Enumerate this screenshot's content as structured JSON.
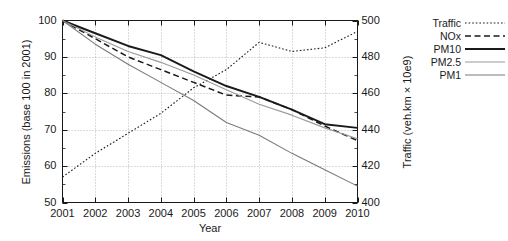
{
  "chart_data": {
    "type": "line",
    "title": "",
    "xlabel": "Year",
    "ylabel": "Emissions (base 100 in 2001)",
    "ylabel_right": "Traffic (veh.km × 10e9)",
    "x": [
      2001,
      2002,
      2003,
      2004,
      2005,
      2006,
      2007,
      2008,
      2009,
      2010
    ],
    "xticks": [
      "2001",
      "2002",
      "2003",
      "2004",
      "2005",
      "2006",
      "2007",
      "2008",
      "2009",
      "2010"
    ],
    "yticks_left": [
      "50",
      "60",
      "70",
      "80",
      "90",
      "100"
    ],
    "yticks_right": [
      "400",
      "420",
      "440",
      "460",
      "480",
      "500"
    ],
    "ylim": [
      50,
      100
    ],
    "ylim_right": [
      400,
      500
    ],
    "xlim": [
      2001,
      2010
    ],
    "grid": true,
    "legend_position": "right-outside",
    "series": [
      {
        "name": "Traffic",
        "axis": "right",
        "style": "dotted",
        "color": "#1a1a1a",
        "values_right": [
          414,
          427,
          438,
          449,
          463,
          473,
          488,
          483,
          485,
          494
        ],
        "values_left": [
          57.0,
          63.5,
          69.0,
          74.5,
          81.5,
          86.5,
          94.0,
          91.5,
          92.5,
          97.0
        ]
      },
      {
        "name": "NOx",
        "axis": "left",
        "style": "dashed",
        "color": "#1a1a1a",
        "values_left": [
          100.0,
          95.0,
          90.0,
          86.5,
          83.0,
          79.5,
          79.0,
          75.5,
          71.0,
          67.0
        ]
      },
      {
        "name": "PM10",
        "axis": "left",
        "style": "solid",
        "color": "#1a1a1a",
        "values_left": [
          100.0,
          96.5,
          93.0,
          90.5,
          86.0,
          82.0,
          79.0,
          75.5,
          71.5,
          70.5
        ]
      },
      {
        "name": "PM2.5",
        "axis": "left",
        "style": "solid",
        "color": "#9a9a9a",
        "values_left": [
          100.0,
          95.5,
          91.5,
          88.5,
          85.0,
          81.0,
          77.0,
          74.0,
          70.5,
          67.5
        ]
      },
      {
        "name": "PM1",
        "axis": "left",
        "style": "solid",
        "color": "#7a7a7a",
        "values_left": [
          100.0,
          93.5,
          88.0,
          83.0,
          78.0,
          72.0,
          68.5,
          63.5,
          59.0,
          54.5
        ]
      }
    ]
  },
  "legend": {
    "items": [
      {
        "label": "Traffic",
        "style": "dotted",
        "color": "#1a1a1a"
      },
      {
        "label": "NOx",
        "style": "dashed",
        "color": "#1a1a1a"
      },
      {
        "label": "PM10",
        "style": "solid",
        "color": "#1a1a1a"
      },
      {
        "label": "PM2.5",
        "style": "solid",
        "color": "#9a9a9a"
      },
      {
        "label": "PM1",
        "style": "solid",
        "color": "#7a7a7a"
      }
    ]
  }
}
